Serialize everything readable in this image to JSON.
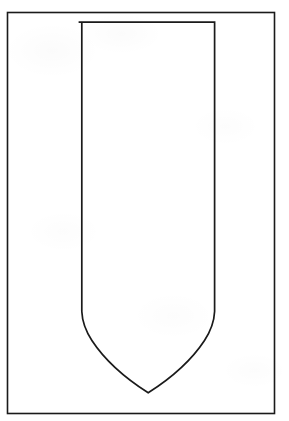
{
  "canvas": {
    "width": 289,
    "height": 421,
    "background_color": "#ffffff",
    "title": "Shield Outline Template"
  },
  "style": {
    "stroke_color": "#1a1a1a",
    "outer_border_stroke_width": 1.6,
    "shield_stroke_width": 1.7,
    "fill": "none"
  },
  "artwork": {
    "type": "line-drawing",
    "description": "Blank heraldic shield / banner outline centered on a plain rectangular border",
    "outer_border": {
      "shape": "rectangle",
      "x": 7.5,
      "y": 12.5,
      "width": 267,
      "height": 401,
      "right": 274.5,
      "bottom": 413.5
    },
    "shield": {
      "shape": "shield-outline",
      "top_y": 22,
      "left_x": 78.5,
      "right_x": 214.5,
      "straight_side_bottom_y": 312,
      "apex_x": 148,
      "apex_y": 393,
      "width": 136,
      "height": 371,
      "path": "M 78.5 22 L 214.5 22 L 214.5 312 C 213.0 334.0 186.0 367.0 148.0 393.0 C 110.0 367.0 83.0 334.0 81.5 312 L 81.5 312 Z"
    }
  },
  "labels": {
    "document_label": "Shield Outline Template",
    "figure_caption": ""
  }
}
